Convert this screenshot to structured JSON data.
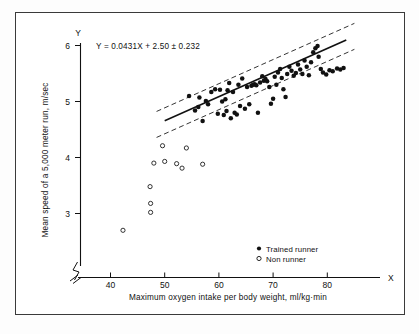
{
  "figure": {
    "equation": "Y = 0.0431X + 2.50 ± 0.232",
    "y_axis_letter": "Y",
    "x_axis_letter": "X",
    "x_title": "Maximum oxygen intake per body weight, ml/kg·min",
    "y_title": "Mean speed of a 5,000 meter run, m/sec",
    "axis_break_marker": "axis-break",
    "colors": {
      "ink": "#111111",
      "frame": "#3a3a3a",
      "background": "#ffffff"
    }
  },
  "legend": {
    "entries": [
      {
        "marker": "filled-circle",
        "label": "Trained runner"
      },
      {
        "marker": "open-circle",
        "label": "Non runner"
      }
    ]
  },
  "chart_data": {
    "type": "scatter",
    "title": "",
    "xlabel": "Maximum oxygen intake per body weight, ml/kg·min",
    "ylabel": "Mean speed of a 5,000 meter run, m/sec",
    "xlim": [
      36,
      86
    ],
    "ylim": [
      2.55,
      6.1
    ],
    "xticks": [
      40,
      50,
      60,
      70,
      80
    ],
    "yticks": [
      3,
      4,
      5,
      6
    ],
    "grid": false,
    "legend_position": "bottom-right",
    "annotations": [
      "Y = 0.0431X + 2.50 ± 0.232"
    ],
    "fit": {
      "label": "Y = 0.0431X + 2.50 ± 0.232",
      "slope": 0.0431,
      "intercept": 2.5,
      "band": 0.232,
      "x_start": 50.0,
      "x_end": 83.5,
      "style": "solid",
      "band_style": "dashed"
    },
    "series": [
      {
        "name": "Trained runner",
        "marker": "filled-circle",
        "points": [
          [
            54.5,
            5.1
          ],
          [
            55.6,
            4.84
          ],
          [
            56.2,
            4.9
          ],
          [
            56.4,
            5.07
          ],
          [
            57.0,
            4.65
          ],
          [
            57.6,
            5.01
          ],
          [
            58.0,
            4.95
          ],
          [
            58.6,
            5.17
          ],
          [
            59.3,
            5.22
          ],
          [
            59.8,
            4.78
          ],
          [
            60.2,
            5.21
          ],
          [
            60.6,
            5.0
          ],
          [
            60.9,
            4.76
          ],
          [
            61.2,
            5.04
          ],
          [
            61.4,
            4.83
          ],
          [
            61.6,
            5.2
          ],
          [
            61.9,
            5.33
          ],
          [
            62.2,
            4.7
          ],
          [
            62.6,
            5.17
          ],
          [
            62.9,
            4.8
          ],
          [
            63.3,
            4.77
          ],
          [
            63.6,
            5.3
          ],
          [
            63.9,
            4.92
          ],
          [
            64.3,
            5.41
          ],
          [
            64.8,
            4.87
          ],
          [
            65.2,
            5.26
          ],
          [
            65.6,
            4.95
          ],
          [
            66.0,
            5.28
          ],
          [
            66.3,
            5.3
          ],
          [
            66.6,
            5.31
          ],
          [
            66.9,
            5.29
          ],
          [
            67.2,
            4.8
          ],
          [
            67.6,
            5.34
          ],
          [
            68.0,
            5.45
          ],
          [
            68.3,
            5.37
          ],
          [
            68.6,
            5.4
          ],
          [
            68.9,
            5.36
          ],
          [
            69.3,
            5.26
          ],
          [
            69.6,
            4.96
          ],
          [
            70.0,
            5.05
          ],
          [
            70.3,
            5.44
          ],
          [
            70.6,
            5.3
          ],
          [
            70.9,
            5.52
          ],
          [
            71.3,
            5.58
          ],
          [
            71.6,
            5.42
          ],
          [
            71.9,
            5.22
          ],
          [
            72.3,
            5.08
          ],
          [
            72.6,
            5.49
          ],
          [
            73.0,
            5.62
          ],
          [
            73.4,
            5.55
          ],
          [
            73.8,
            5.46
          ],
          [
            74.2,
            5.51
          ],
          [
            74.6,
            5.66
          ],
          [
            75.0,
            5.57
          ],
          [
            75.4,
            5.49
          ],
          [
            75.8,
            5.73
          ],
          [
            76.2,
            5.62
          ],
          [
            76.6,
            5.47
          ],
          [
            77.0,
            5.7
          ],
          [
            77.4,
            5.88
          ],
          [
            77.8,
            5.95
          ],
          [
            78.2,
            5.99
          ],
          [
            78.4,
            5.8
          ],
          [
            78.8,
            5.58
          ],
          [
            79.2,
            5.52
          ],
          [
            79.8,
            5.48
          ],
          [
            80.4,
            5.56
          ],
          [
            81.0,
            5.54
          ],
          [
            81.8,
            5.59
          ],
          [
            82.4,
            5.57
          ],
          [
            83.0,
            5.6
          ]
        ]
      },
      {
        "name": "Non runner",
        "marker": "open-circle",
        "points": [
          [
            42.3,
            2.7
          ],
          [
            47.4,
            3.02
          ],
          [
            47.4,
            3.18
          ],
          [
            47.3,
            3.48
          ],
          [
            48.0,
            3.9
          ],
          [
            49.6,
            4.21
          ],
          [
            50.0,
            3.93
          ],
          [
            52.2,
            3.89
          ],
          [
            53.2,
            3.81
          ],
          [
            54.0,
            4.17
          ],
          [
            57.0,
            3.88
          ]
        ]
      }
    ]
  }
}
